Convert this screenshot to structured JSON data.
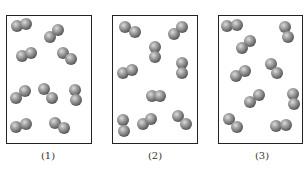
{
  "figure": {
    "sphere_radius": 6,
    "colors": {
      "sphere_light": "#d8d8d8",
      "sphere_mid": "#9a9a9a",
      "sphere_dark": "#4e4e4e",
      "border": "#222222",
      "label": "#333333"
    }
  },
  "panels": [
    {
      "label": "(1)",
      "box": {
        "x": 6,
        "y": 15,
        "w": 86,
        "h": 129
      },
      "label_pos": {
        "x": 48,
        "y": 150
      },
      "molecules": [
        [
          [
            17,
            26
          ],
          [
            26,
            24
          ]
        ],
        [
          [
            50,
            37
          ],
          [
            58,
            30
          ]
        ],
        [
          [
            22,
            56
          ],
          [
            31,
            53
          ]
        ],
        [
          [
            63,
            53
          ],
          [
            71,
            59
          ]
        ],
        [
          [
            16,
            98
          ],
          [
            25,
            91
          ]
        ],
        [
          [
            44,
            89
          ],
          [
            52,
            98
          ]
        ],
        [
          [
            75,
            90
          ],
          [
            76,
            100
          ]
        ],
        [
          [
            16,
            127
          ],
          [
            26,
            124
          ]
        ],
        [
          [
            55,
            123
          ],
          [
            64,
            128
          ]
        ]
      ]
    },
    {
      "label": "(2)",
      "box": {
        "x": 112,
        "y": 15,
        "w": 86,
        "h": 129
      },
      "label_pos": {
        "x": 155,
        "y": 150
      },
      "molecules": [
        [
          [
            125,
            27
          ],
          [
            135,
            32
          ]
        ],
        [
          [
            174,
            34
          ],
          [
            182,
            27
          ]
        ],
        [
          [
            155,
            47
          ],
          [
            155,
            57
          ]
        ],
        [
          [
            123,
            73
          ],
          [
            132,
            70
          ]
        ],
        [
          [
            182,
            63
          ],
          [
            182,
            73
          ]
        ],
        [
          [
            152,
            96
          ],
          [
            160,
            96
          ]
        ],
        [
          [
            123,
            120
          ],
          [
            124,
            131
          ]
        ],
        [
          [
            143,
            124
          ],
          [
            151,
            119
          ]
        ],
        [
          [
            178,
            116
          ],
          [
            186,
            124
          ]
        ]
      ]
    },
    {
      "label": "(3)",
      "box": {
        "x": 218,
        "y": 15,
        "w": 85,
        "h": 129
      },
      "label_pos": {
        "x": 262,
        "y": 150
      },
      "molecules": [
        [
          [
            227,
            26
          ],
          [
            237,
            25
          ]
        ],
        [
          [
            285,
            27
          ],
          [
            288,
            37
          ]
        ],
        [
          [
            242,
            48
          ],
          [
            250,
            41
          ]
        ],
        [
          [
            236,
            76
          ],
          [
            245,
            71
          ]
        ],
        [
          [
            271,
            64
          ],
          [
            277,
            73
          ]
        ],
        [
          [
            250,
            102
          ],
          [
            259,
            95
          ]
        ],
        [
          [
            293,
            94
          ],
          [
            294,
            104
          ]
        ],
        [
          [
            229,
            119
          ],
          [
            237,
            127
          ]
        ],
        [
          [
            276,
            126
          ],
          [
            286,
            125
          ]
        ]
      ]
    }
  ]
}
